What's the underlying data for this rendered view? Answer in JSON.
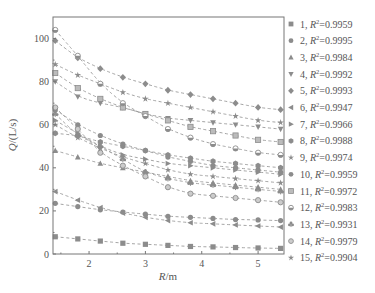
{
  "chart_data": {
    "type": "scatter",
    "title": "",
    "xlabel": "R/m",
    "ylabel": "Q/(L/s)",
    "xlim": [
      1.36,
      5.46
    ],
    "ylim": [
      0,
      110
    ],
    "xticks": [
      2,
      3,
      4,
      5
    ],
    "yticks": [
      0,
      20,
      40,
      60,
      80,
      100
    ],
    "grid": false,
    "legend_position": "right",
    "fit_lines": "dashed",
    "x": [
      1.4,
      1.8,
      2.2,
      2.6,
      3.0,
      3.4,
      3.8,
      4.2,
      4.6,
      5.0,
      5.4
    ],
    "series": [
      {
        "name": "1",
        "r2": "0.9959",
        "marker": "square",
        "values": [
          8,
          7,
          6,
          5,
          4.5,
          4,
          3.5,
          3.3,
          3,
          2.8,
          2.6
        ]
      },
      {
        "name": "2",
        "r2": "0.9995",
        "marker": "circle",
        "values": [
          23.5,
          22,
          20.5,
          19.5,
          18.5,
          17.5,
          17,
          16.5,
          16,
          15.8,
          15.5
        ]
      },
      {
        "name": "3",
        "r2": "0.9984",
        "marker": "triangle-up",
        "values": [
          48,
          45,
          42,
          40,
          38,
          36,
          34,
          33,
          32,
          31,
          30
        ]
      },
      {
        "name": "4",
        "r2": "0.9992",
        "marker": "triangle-down",
        "values": [
          80,
          73,
          70,
          68,
          65,
          63,
          62,
          61,
          60,
          59,
          58
        ]
      },
      {
        "name": "5",
        "r2": "0.9993",
        "marker": "diamond",
        "values": [
          99,
          91,
          86,
          82,
          79,
          76,
          74,
          72,
          70,
          68,
          67
        ]
      },
      {
        "name": "6",
        "r2": "0.9947",
        "marker": "triangle-left",
        "values": [
          29,
          25,
          21.5,
          19,
          17,
          15.5,
          14.5,
          14,
          13.5,
          13,
          12.5
        ]
      },
      {
        "name": "7",
        "r2": "0.9966",
        "marker": "triangle-right",
        "values": [
          62,
          56,
          50,
          46,
          44,
          42,
          41,
          40,
          39,
          38,
          37
        ]
      },
      {
        "name": "8",
        "r2": "0.9988",
        "marker": "hexagon",
        "values": [
          56,
          55,
          52,
          50,
          48,
          46,
          44.5,
          43,
          42,
          41,
          40
        ]
      },
      {
        "name": "9",
        "r2": "0.9974",
        "marker": "star",
        "values": [
          88,
          83,
          79,
          75,
          72,
          70,
          68,
          66,
          64,
          62,
          61
        ]
      },
      {
        "name": "10",
        "r2": "0.9959",
        "marker": "circle",
        "values": [
          67,
          60,
          55,
          51,
          48,
          45,
          43,
          41,
          40,
          39,
          38
        ]
      },
      {
        "name": "11",
        "r2": "0.9972",
        "marker": "square-open",
        "values": [
          84,
          77,
          72,
          68,
          65,
          62,
          59,
          57,
          55,
          53,
          52
        ]
      },
      {
        "name": "12",
        "r2": "0.9983",
        "marker": "circle-half",
        "values": [
          104,
          92,
          79,
          70,
          64,
          58,
          54,
          51,
          49,
          47,
          46
        ]
      },
      {
        "name": "13",
        "r2": "0.9931",
        "marker": "club",
        "values": [
          65,
          55,
          50,
          44,
          38,
          35,
          33,
          32,
          31,
          30,
          29
        ]
      },
      {
        "name": "14",
        "r2": "0.9979",
        "marker": "circle-open",
        "values": [
          68,
          58,
          47,
          41,
          36,
          31,
          28,
          27,
          26,
          25,
          24
        ]
      },
      {
        "name": "15",
        "r2": "0.9904",
        "marker": "star",
        "values": [
          60,
          54,
          49,
          45,
          42,
          39,
          37,
          36,
          35,
          34,
          33
        ]
      }
    ]
  },
  "axes": {
    "xlabel_italic": "R",
    "xlabel_unit": "/m",
    "ylabel_italic": "Q",
    "ylabel_unit": "/(L/s)"
  },
  "legend": {
    "r2_symbol": "R",
    "r2_sup": "2",
    "separator": ", ",
    "equals": "="
  },
  "colors": {
    "axis": "#777777",
    "marker": "#8c8c8c",
    "line": "#9a9a9a",
    "text": "#555555"
  }
}
